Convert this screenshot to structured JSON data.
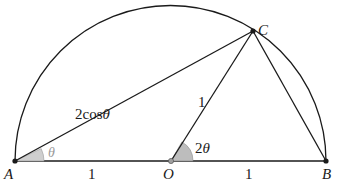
{
  "diagram": {
    "type": "geometry",
    "points": {
      "A": {
        "label": "A"
      },
      "O": {
        "label": "O"
      },
      "B": {
        "label": "B"
      },
      "C": {
        "label": "C"
      }
    },
    "segment_labels": {
      "AC": "2cosθ",
      "OC": "1",
      "AO": "1",
      "OB": "1"
    },
    "angle_labels": {
      "at_A": "θ",
      "at_O": "2θ"
    },
    "colors": {
      "line": "#1a1a1a",
      "angle_fill": "#c8c8c8",
      "angle_label_A": "#9a9a9a",
      "angle_label_O": "#1a1a1a",
      "point_O_fill": "#a0a0a0"
    }
  }
}
